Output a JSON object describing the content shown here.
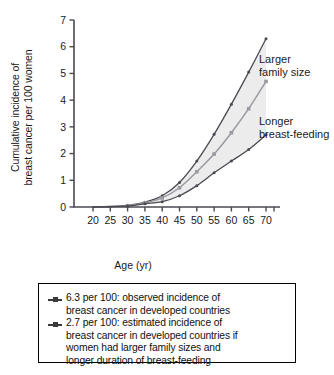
{
  "chart_data": {
    "type": "line",
    "title": "",
    "xlabel": "Age (yr)",
    "ylabel_line1": "Cumulative incidence of",
    "ylabel_line2": "breast cancer per 100 women",
    "xlim": [
      17.5,
      72.5
    ],
    "ylim": [
      0,
      7
    ],
    "xticks": [
      20,
      25,
      30,
      35,
      40,
      45,
      50,
      55,
      60,
      65,
      70
    ],
    "yticks": [
      0,
      1,
      2,
      3,
      4,
      5,
      6,
      7
    ],
    "grid": false,
    "legend_position": "below-plot",
    "x": [
      20,
      25,
      30,
      35,
      40,
      45,
      50,
      55,
      60,
      65,
      70
    ],
    "series": [
      {
        "name": "Observed incidence (6.3 per 100)",
        "color": "#4a4a52",
        "marker": "dot",
        "values": [
          0.0,
          0.02,
          0.06,
          0.18,
          0.42,
          0.92,
          1.72,
          2.72,
          3.85,
          5.05,
          6.3
        ]
      },
      {
        "name": "Longer breast-feeding",
        "color": "#9a9aa0",
        "marker": "square",
        "values": [
          0.0,
          0.02,
          0.05,
          0.15,
          0.34,
          0.72,
          1.32,
          1.98,
          2.78,
          3.68,
          4.7
        ]
      },
      {
        "name": "Estimated incidence (2.7 per 100)",
        "color": "#4a4a52",
        "marker": "dot",
        "values": [
          0.0,
          0.01,
          0.04,
          0.12,
          0.2,
          0.42,
          0.8,
          1.28,
          1.72,
          2.15,
          2.7
        ]
      }
    ],
    "band": {
      "between": [
        "Observed incidence (6.3 per 100)",
        "Estimated incidence (2.7 per 100)"
      ],
      "fill": "#ececed"
    },
    "annotations": [
      {
        "id": "larger",
        "line1": "Larger",
        "line2": "family size"
      },
      {
        "id": "longer",
        "line1": "Longer",
        "line2": "breast-feeding"
      }
    ]
  },
  "legend": {
    "entries": [
      {
        "marker": "line-square-marker",
        "line1": "6.3 per 100: observed incidence of",
        "line2": "breast cancer in developed countries",
        "line3": "",
        "line4": ""
      },
      {
        "marker": "line-square-marker",
        "line1": "2.7 per 100: estimated incidence of",
        "line2": "breast cancer in developed countries if",
        "line3": "women had larger family sizes and",
        "line4": "longer duration of breast-feeding"
      }
    ]
  }
}
